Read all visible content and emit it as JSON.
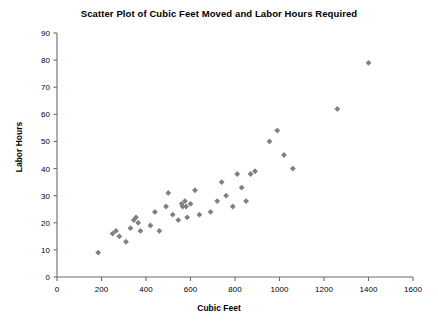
{
  "chart_data": {
    "type": "scatter",
    "title": "Scatter Plot of Cubic Feet Moved and Labor Hours Required",
    "xlabel": "Cubic Feet",
    "ylabel": "Labor Hours",
    "xlim": [
      0,
      1600
    ],
    "ylim": [
      0,
      90
    ],
    "xticks": [
      0,
      200,
      400,
      600,
      800,
      1000,
      1200,
      1400,
      1600
    ],
    "yticks": [
      0,
      10,
      20,
      30,
      40,
      50,
      60,
      70,
      80,
      90
    ],
    "grid": false,
    "legend": false,
    "marker": "diamond",
    "marker_color": "#808080",
    "points": [
      {
        "x": 185,
        "y": 9
      },
      {
        "x": 250,
        "y": 16
      },
      {
        "x": 265,
        "y": 17
      },
      {
        "x": 280,
        "y": 15
      },
      {
        "x": 310,
        "y": 13
      },
      {
        "x": 330,
        "y": 18
      },
      {
        "x": 345,
        "y": 21
      },
      {
        "x": 355,
        "y": 22
      },
      {
        "x": 365,
        "y": 20
      },
      {
        "x": 375,
        "y": 17
      },
      {
        "x": 420,
        "y": 19
      },
      {
        "x": 440,
        "y": 24
      },
      {
        "x": 460,
        "y": 17
      },
      {
        "x": 490,
        "y": 26
      },
      {
        "x": 500,
        "y": 31
      },
      {
        "x": 520,
        "y": 23
      },
      {
        "x": 545,
        "y": 21
      },
      {
        "x": 560,
        "y": 27
      },
      {
        "x": 565,
        "y": 26
      },
      {
        "x": 575,
        "y": 28
      },
      {
        "x": 580,
        "y": 26
      },
      {
        "x": 585,
        "y": 22
      },
      {
        "x": 600,
        "y": 27
      },
      {
        "x": 620,
        "y": 32
      },
      {
        "x": 640,
        "y": 23
      },
      {
        "x": 690,
        "y": 24
      },
      {
        "x": 720,
        "y": 28
      },
      {
        "x": 740,
        "y": 35
      },
      {
        "x": 760,
        "y": 30
      },
      {
        "x": 790,
        "y": 26
      },
      {
        "x": 810,
        "y": 38
      },
      {
        "x": 830,
        "y": 33
      },
      {
        "x": 850,
        "y": 28
      },
      {
        "x": 870,
        "y": 38
      },
      {
        "x": 890,
        "y": 39
      },
      {
        "x": 955,
        "y": 50
      },
      {
        "x": 990,
        "y": 54
      },
      {
        "x": 1020,
        "y": 45
      },
      {
        "x": 1060,
        "y": 40
      },
      {
        "x": 1260,
        "y": 62
      },
      {
        "x": 1400,
        "y": 79
      }
    ]
  }
}
